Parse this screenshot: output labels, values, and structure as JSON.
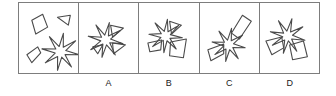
{
  "puzzle": {
    "type": "shape-assembly-multiple-choice",
    "panel_count": 5,
    "border_color": "#7d7d7d",
    "shape_stroke_color": "#4a4a4a",
    "background_color": "#ffffff",
    "panels": [
      {
        "id": "prompt",
        "label": "",
        "is_prompt": true,
        "description": "four separate pieces: quadrilateral, small triangle, small quadrilateral, eight-pointed star",
        "shapes": [
          {
            "name": "quadrilateral-top-left",
            "kind": "polygon",
            "points": "13,17 24,11 29,24 17,31"
          },
          {
            "name": "triangle-top-right",
            "kind": "polygon",
            "points": "39,14 52,12 50,22"
          },
          {
            "name": "quadrilateral-bottom-left",
            "kind": "polygon",
            "points": "8,52 19,44 22,50 13,60"
          },
          {
            "name": "eight-point-star",
            "kind": "star",
            "cx": 42,
            "cy": 49,
            "points_count": 8,
            "outer_radius": 19,
            "inner_radius": 5.5,
            "rotation_deg": 9
          }
        ]
      },
      {
        "id": "option-a",
        "label": "A",
        "is_prompt": false,
        "description": "star with two triangles attached on the right side",
        "shapes": [
          {
            "name": "eight-point-star",
            "kind": "star",
            "cx": 27,
            "cy": 37,
            "points_count": 8,
            "outer_radius": 18,
            "inner_radius": 5,
            "rotation_deg": 12
          },
          {
            "name": "triangle-upper-right",
            "kind": "polygon",
            "points": "32,22 45,25 34,34"
          },
          {
            "name": "triangle-lower-right",
            "kind": "polygon",
            "points": "34,40 47,42 35,51"
          },
          {
            "name": "triangle-lower-left",
            "kind": "polygon",
            "points": "14,44 24,42 19,51"
          }
        ]
      },
      {
        "id": "option-b",
        "label": "B",
        "is_prompt": false,
        "description": "star with a triangle upper-right and a large quadrilateral lower-right",
        "shapes": [
          {
            "name": "eight-point-star",
            "kind": "star",
            "cx": 27,
            "cy": 33,
            "points_count": 8,
            "outer_radius": 17,
            "inner_radius": 5,
            "rotation_deg": 6
          },
          {
            "name": "triangle-upper-right",
            "kind": "polygon",
            "points": "31,18 43,22 33,31"
          },
          {
            "name": "quadrilateral-lower-right",
            "kind": "polygon",
            "points": "32,39 48,36 45,55 31,53"
          },
          {
            "name": "quadrilateral-lower-left",
            "kind": "polygon",
            "points": "9,40 23,37 22,47 11,49"
          }
        ]
      },
      {
        "id": "option-c",
        "label": "C",
        "is_prompt": false,
        "description": "star with an elongated tilted rectangle above-right and a quadrilateral to the left",
        "shapes": [
          {
            "name": "eight-point-star",
            "kind": "star",
            "cx": 29,
            "cy": 42,
            "points_count": 8,
            "outer_radius": 17,
            "inner_radius": 5,
            "rotation_deg": 10
          },
          {
            "name": "elongated-rectangle-upper-right",
            "kind": "polygon",
            "points": "32,30 43,12 52,18 40,36"
          },
          {
            "name": "quadrilateral-left",
            "kind": "polygon",
            "points": "8,47 24,41 24,51 11,58"
          }
        ]
      },
      {
        "id": "option-d",
        "label": "D",
        "is_prompt": false,
        "description": "star with quadrilaterals at lower-left and lower-right",
        "shapes": [
          {
            "name": "eight-point-star",
            "kind": "star",
            "cx": 28,
            "cy": 33,
            "points_count": 8,
            "outer_radius": 18,
            "inner_radius": 5,
            "rotation_deg": 14
          },
          {
            "name": "quadrilateral-lower-left",
            "kind": "polygon",
            "points": "6,38 22,34 24,45 12,52"
          },
          {
            "name": "quadrilateral-lower-right",
            "kind": "polygon",
            "points": "30,42 44,38 48,54 33,57"
          }
        ]
      }
    ],
    "option_labels": [
      "",
      "A",
      "B",
      "C",
      "D"
    ]
  }
}
